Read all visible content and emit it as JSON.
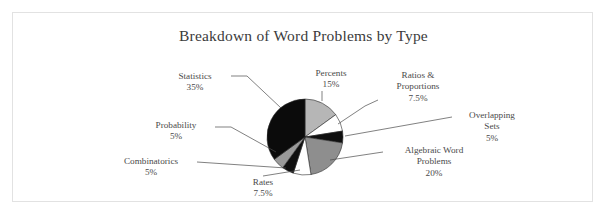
{
  "figure": {
    "title": "Breakdown of Word Problems by Type",
    "frame_color": "#e2e2e2",
    "background": "#ffffff",
    "text_color": "#4a4a4a"
  },
  "chart_data": {
    "type": "pie",
    "title": "Breakdown of Word Problems by Type",
    "xlabel": "",
    "ylabel": "",
    "start_angle_deg": 0,
    "direction": "clockwise",
    "legend": "none",
    "grid": false,
    "categories": [
      "Percents",
      "Ratios & Proportions",
      "Overlapping Sets",
      "Algebraic Word Problems",
      "Rates",
      "Combinatorics",
      "Probability",
      "Statistics"
    ],
    "values": [
      15,
      7.5,
      5,
      20,
      7.5,
      5,
      5,
      35
    ],
    "value_labels": [
      "15%",
      "7.5%",
      "5%",
      "20%",
      "7.5%",
      "5%",
      "5%",
      "35%"
    ],
    "colors": [
      "#b6b6b6",
      "#ffffff",
      "#101010",
      "#8e8e8e",
      "#ffffff",
      "#101010",
      "#9a9a9a",
      "#0b0b0b"
    ],
    "slices": [
      {
        "label": "Percents",
        "value": 15,
        "pct": "15%",
        "color": "#b6b6b6"
      },
      {
        "label": "Ratios & Proportions",
        "value": 7.5,
        "pct": "7.5%",
        "color": "#ffffff"
      },
      {
        "label": "Overlapping Sets",
        "value": 5,
        "pct": "5%",
        "color": "#101010"
      },
      {
        "label": "Algebraic Word Problems",
        "value": 20,
        "pct": "20%",
        "color": "#8e8e8e"
      },
      {
        "label": "Rates",
        "value": 7.5,
        "pct": "7.5%",
        "color": "#ffffff"
      },
      {
        "label": "Combinatorics",
        "value": 5,
        "pct": "5%",
        "color": "#101010"
      },
      {
        "label": "Probability",
        "value": 5,
        "pct": "5%",
        "color": "#9a9a9a"
      },
      {
        "label": "Statistics",
        "value": 35,
        "pct": "35%",
        "color": "#0b0b0b"
      }
    ]
  },
  "callouts": {
    "statistics": {
      "name": "Statistics",
      "pct": "35%"
    },
    "probability": {
      "name": "Probability",
      "pct": "5%"
    },
    "combinatorics": {
      "name": "Combinatorics",
      "pct": "5%"
    },
    "rates": {
      "name": "Rates",
      "pct": "7.5%"
    },
    "percents": {
      "name": "Percents",
      "pct": "15%"
    },
    "ratios": {
      "name_line1": "Ratios &",
      "name_line2": "Proportions",
      "pct": "7.5%"
    },
    "overlapping": {
      "name_line1": "Overlapping",
      "name_line2": "Sets",
      "pct": "5%"
    },
    "algebraic": {
      "name_line1": "Algebraic Word",
      "name_line2": "Problems",
      "pct": "20%"
    }
  }
}
